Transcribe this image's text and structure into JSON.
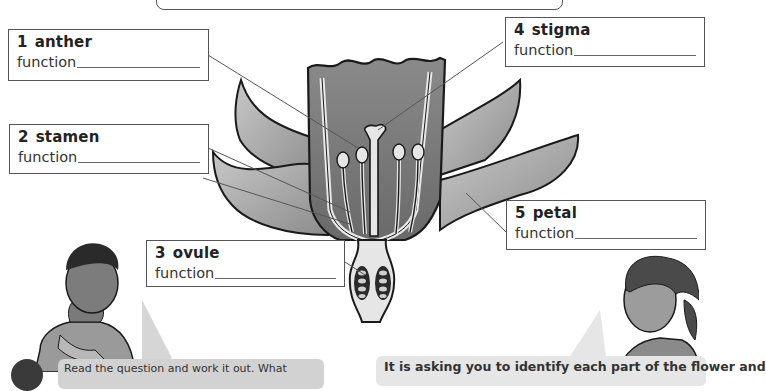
{
  "diagram": {
    "labels": [
      {
        "number": "1",
        "name": "anther",
        "function_label": "function"
      },
      {
        "number": "2",
        "name": "stamen",
        "function_label": "function"
      },
      {
        "number": "3",
        "name": "ovule",
        "function_label": "function"
      },
      {
        "number": "4",
        "name": "stigma",
        "function_label": "function"
      },
      {
        "number": "5",
        "name": "petal",
        "function_label": "function"
      }
    ]
  },
  "dialogue": {
    "step_number": "1",
    "left_bubble": "Read the question and work it out. What",
    "right_bubble": "It is asking you to identify each part of the flower and"
  },
  "colors": {
    "outline": "#1a1a1a",
    "petal_fill": "#a8a8a8",
    "inner_fill": "#7a7a7a",
    "bubble": "#d6d6d6"
  }
}
